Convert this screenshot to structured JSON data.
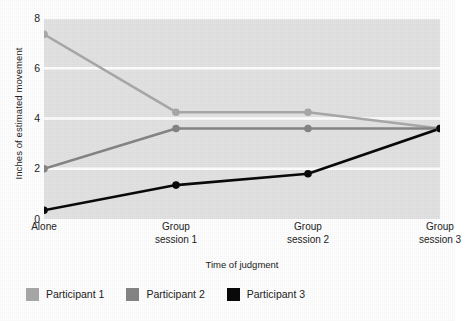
{
  "chart_data": {
    "type": "line",
    "title": "",
    "xlabel": "Time of judgment",
    "ylabel": "Inches of estimated movement",
    "categories": [
      "Alone",
      "Group session 1",
      "Group session 2",
      "Group session 3"
    ],
    "category_lines": [
      [
        "Alone",
        ""
      ],
      [
        "Group",
        "session 1"
      ],
      [
        "Group",
        "session 2"
      ],
      [
        "Group",
        "session 3"
      ]
    ],
    "ylim": [
      0,
      8
    ],
    "yticks": [
      0,
      2,
      4,
      6,
      8
    ],
    "ytick_labels": [
      "0",
      "2",
      "4",
      "6",
      "8"
    ],
    "grid": "horizontal",
    "legend_position": "below",
    "plot_background": "#e3e3e3",
    "gridline_color": "#ffffff",
    "series": [
      {
        "name": "Participant 1",
        "color": "#a9a9a9",
        "values": [
          7.35,
          4.25,
          4.25,
          3.6
        ]
      },
      {
        "name": "Participant 2",
        "color": "#858585",
        "values": [
          2.0,
          3.6,
          3.6,
          3.6
        ]
      },
      {
        "name": "Participant 3",
        "color": "#0a0a0a",
        "values": [
          0.35,
          1.35,
          1.8,
          3.6
        ]
      }
    ]
  },
  "legend": {
    "items": [
      {
        "label": "Participant 1",
        "color": "#a9a9a9"
      },
      {
        "label": "Participant 2",
        "color": "#858585"
      },
      {
        "label": "Participant 3",
        "color": "#0a0a0a"
      }
    ]
  }
}
